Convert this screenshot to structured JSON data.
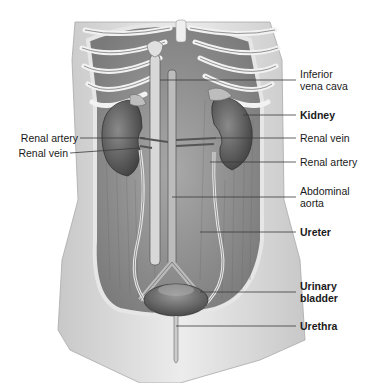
{
  "figure": {
    "colors": {
      "line": "#3a3a3a",
      "skin": "#d9d9d9",
      "muscle": "#9a9a9a",
      "organ": "#6e6e6e",
      "bone": "#ececec"
    }
  },
  "labels": {
    "right": [
      {
        "id": "ivc",
        "line1": "Inferior",
        "line2": "vena cava",
        "bold": false
      },
      {
        "id": "kidney",
        "line1": "Kidney",
        "bold": true
      },
      {
        "id": "renal-vein-r",
        "line1": "Renal vein",
        "bold": false
      },
      {
        "id": "renal-artery-r",
        "line1": "Renal artery",
        "bold": false
      },
      {
        "id": "aorta",
        "line1": "Abdominal",
        "line2": "aorta",
        "bold": false
      },
      {
        "id": "ureter",
        "line1": "Ureter",
        "bold": true
      },
      {
        "id": "bladder",
        "line1": "Urinary",
        "line2": "bladder",
        "bold": true
      },
      {
        "id": "urethra",
        "line1": "Urethra",
        "bold": true
      }
    ],
    "left": [
      {
        "id": "renal-artery-l",
        "line1": "Renal artery",
        "bold": false
      },
      {
        "id": "renal-vein-l",
        "line1": "Renal vein",
        "bold": false
      }
    ]
  }
}
